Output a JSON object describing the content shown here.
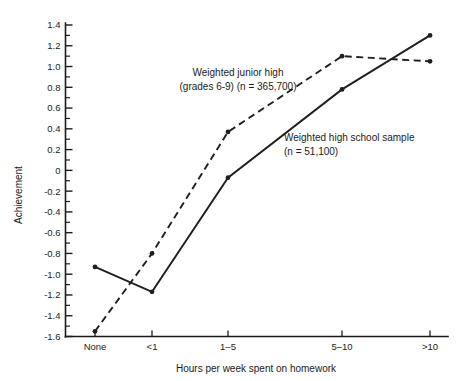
{
  "chart_data": {
    "type": "line",
    "title": "",
    "xlabel": "Hours per week spent on homework",
    "ylabel": "Achievement",
    "categories": [
      "None",
      "<1",
      "1–5",
      "5–10",
      ">10"
    ],
    "ylim": [
      -1.6,
      1.4
    ],
    "ytick_step": 0.2,
    "yticks": [
      "1.4",
      "1.2",
      "1.0",
      "0.8",
      "0.6",
      "0.4",
      "0.2",
      "0",
      "-0.2",
      "-0.4",
      "-0.6",
      "-0.8",
      "-1.0",
      "-1.2",
      "-1.4",
      "-1.6"
    ],
    "ytick_values": [
      1.4,
      1.2,
      1.0,
      0.8,
      0.6,
      0.4,
      0.2,
      0,
      -0.2,
      -0.4,
      -0.6,
      -0.8,
      -1.0,
      -1.2,
      -1.4,
      -1.6
    ],
    "minor_ticks": true,
    "grid": false,
    "legend_position": "inline-annotations",
    "series": [
      {
        "name": "Weighted junior high (grades 6-9) (n = 365,700)",
        "style": "dashed",
        "values": [
          -1.55,
          -0.8,
          0.37,
          1.1,
          1.05
        ]
      },
      {
        "name": "Weighted high school sample (n = 51,100)",
        "style": "solid",
        "values": [
          -0.93,
          -1.17,
          -0.07,
          0.78,
          1.3
        ]
      }
    ],
    "annotations": [
      {
        "id": "junior-high-annotation",
        "line1": "Weighted junior high",
        "line2": "(grades 6-9) (n = 365,700)"
      },
      {
        "id": "high-school-annotation",
        "line1": "Weighted high school sample",
        "line2": "(n = 51,100)"
      }
    ]
  },
  "colors": {
    "ink": "#1b1b1b",
    "series": "#1f1f1f",
    "background": "#ffffff"
  }
}
